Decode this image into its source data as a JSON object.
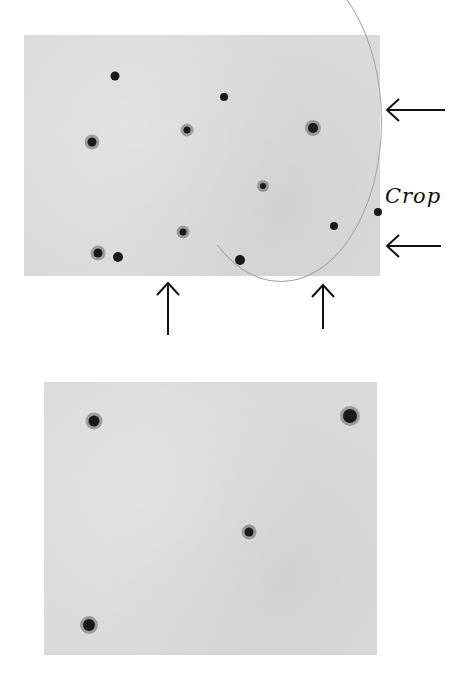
{
  "annotations": {
    "crop_label": "Crop"
  },
  "top_panel": {
    "dots": [
      {
        "x": 115,
        "y": 76,
        "r": 4.5,
        "halo": false
      },
      {
        "x": 224,
        "y": 97,
        "r": 4,
        "halo": false
      },
      {
        "x": 92,
        "y": 142,
        "r": 4.5,
        "halo": true
      },
      {
        "x": 187,
        "y": 130,
        "r": 3.5,
        "halo": true
      },
      {
        "x": 313,
        "y": 128,
        "r": 5,
        "halo": true
      },
      {
        "x": 263,
        "y": 186,
        "r": 3,
        "halo": true
      },
      {
        "x": 183,
        "y": 232,
        "r": 3.5,
        "halo": true
      },
      {
        "x": 334,
        "y": 226,
        "r": 4,
        "halo": false
      },
      {
        "x": 98,
        "y": 253,
        "r": 4.5,
        "halo": true
      },
      {
        "x": 118,
        "y": 257,
        "r": 5,
        "halo": false
      },
      {
        "x": 240,
        "y": 260,
        "r": 5,
        "halo": false
      },
      {
        "x": 378,
        "y": 212,
        "r": 4,
        "halo": false
      }
    ]
  },
  "bottom_panel": {
    "dots": [
      {
        "x": 94,
        "y": 421,
        "r": 5.5,
        "halo": true
      },
      {
        "x": 350,
        "y": 416,
        "r": 7,
        "halo": true
      },
      {
        "x": 249,
        "y": 532,
        "r": 4.5,
        "halo": true
      },
      {
        "x": 89,
        "y": 625,
        "r": 6,
        "halo": true
      }
    ]
  }
}
